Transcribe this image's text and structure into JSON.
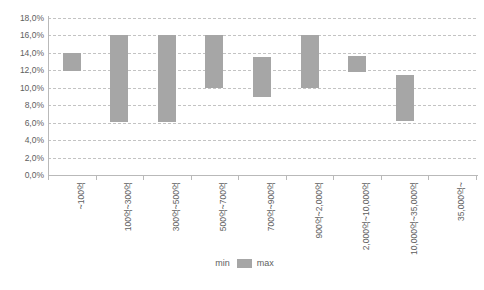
{
  "chart_data": {
    "type": "bar",
    "title": "",
    "subtitle": "",
    "xlabel": "",
    "ylabel": "",
    "ylim": [
      0,
      18
    ],
    "ytick_labels": [
      "18,0%",
      "16,0%",
      "14,0%",
      "12,0%",
      "10,0%",
      "8,0%",
      "6,0%",
      "4,0%",
      "2,0%",
      "0,0%"
    ],
    "ytick_values": [
      18,
      16,
      14,
      12,
      10,
      8,
      6,
      4,
      2,
      0
    ],
    "grid": true,
    "grid_style": "dashed",
    "legend_position": "bottom",
    "bar_style": "floating-range",
    "categories": [
      "~100억",
      "100억~300억",
      "300억~500억",
      "500억~700억",
      "700억~900억",
      "900억~2,000억",
      "2,000억~10,000억",
      "10,000억~35,000억",
      "35,000억~"
    ],
    "series": [
      {
        "name": "min",
        "color": "transparent",
        "values": [
          11.9,
          6.1,
          6.1,
          10.0,
          9.0,
          10.0,
          11.8,
          6.2,
          null
        ]
      },
      {
        "name": "max",
        "color": "#a6a6a6",
        "values": [
          14.0,
          16.0,
          16.0,
          16.0,
          13.5,
          16.0,
          13.7,
          11.5,
          null
        ]
      }
    ],
    "legend_entries": [
      {
        "label": "min",
        "color": "transparent"
      },
      {
        "label": "max",
        "color": "#a6a6a6"
      }
    ],
    "colors": {
      "bar_max": "#a6a6a6",
      "gridline": "#c3c3c3",
      "axis": "#b9b9b9",
      "text": "#5e5e5e",
      "background": "#ffffff"
    }
  }
}
